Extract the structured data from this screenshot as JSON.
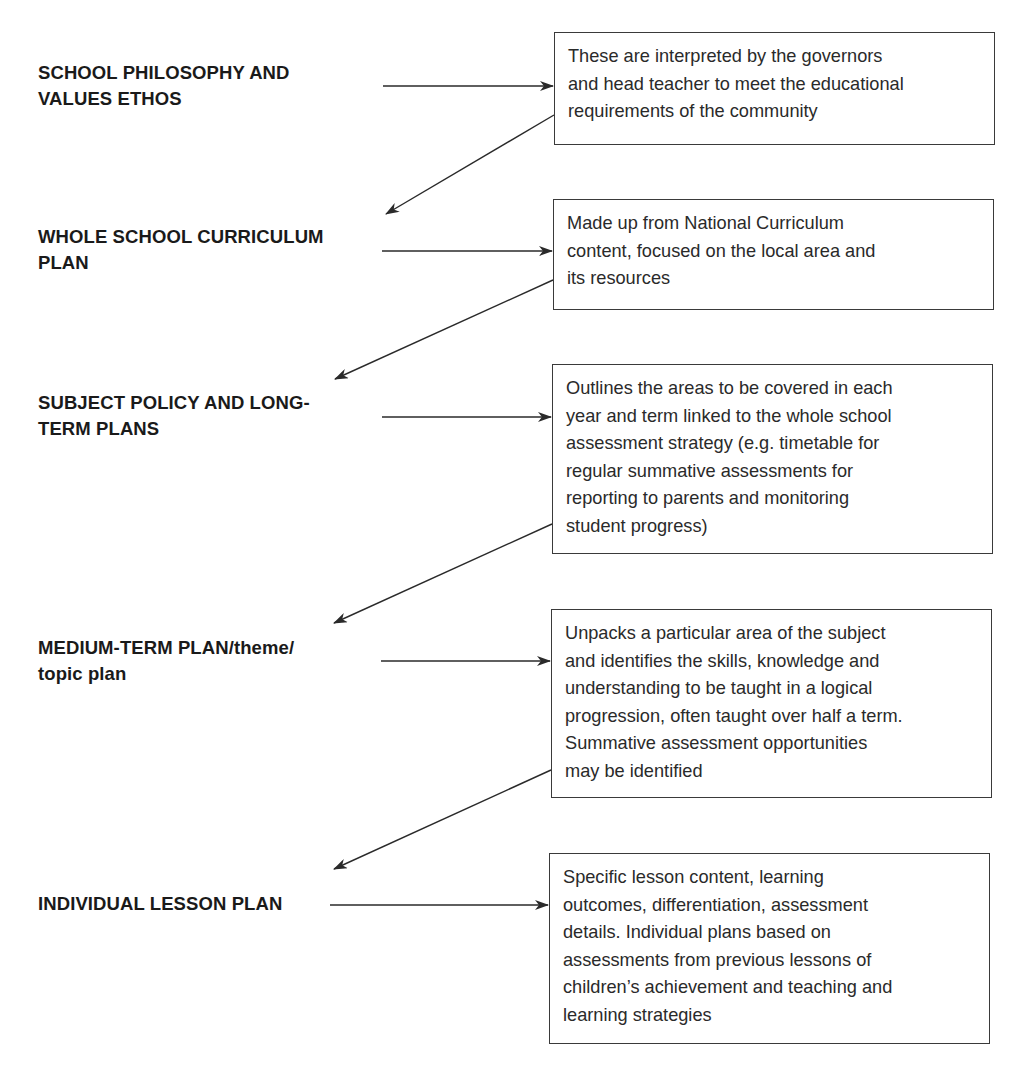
{
  "diagram": {
    "type": "flowchart",
    "stages": [
      {
        "label_lines": [
          "SCHOOL PHILOSOPHY AND",
          "VALUES ETHOS"
        ],
        "description_lines": [
          "These are interpreted by the governors",
          "and head teacher to meet the educational",
          "requirements of the community"
        ]
      },
      {
        "label_lines": [
          "WHOLE SCHOOL CURRICULUM",
          "PLAN"
        ],
        "description_lines": [
          "Made up from National Curriculum",
          "content, focused on the local area and",
          "its resources"
        ]
      },
      {
        "label_lines": [
          "SUBJECT POLICY AND LONG-",
          "TERM PLANS"
        ],
        "description_lines": [
          "Outlines the areas to be covered in each",
          "year and term linked to the whole school",
          "assessment strategy (e.g. timetable for",
          "regular summative assessments for",
          "reporting to parents and monitoring",
          "student progress)"
        ]
      },
      {
        "label_lines": [
          "MEDIUM-TERM PLAN/theme/",
          "topic plan"
        ],
        "description_lines": [
          "Unpacks a particular area of the subject",
          "and identifies the skills, knowledge and",
          "understanding to be taught in a logical",
          "progression, often taught over half a term.",
          "Summative assessment opportunities",
          "may be identified"
        ]
      },
      {
        "label_lines": [
          "INDIVIDUAL LESSON PLAN"
        ],
        "description_lines": [
          "Specific lesson content, learning",
          "outcomes, differentiation, assessment",
          "details. Individual plans based on",
          "assessments from previous lessons of",
          "children’s achievement and teaching and",
          "learning strategies"
        ]
      }
    ],
    "edges": [
      {
        "from": "stage-1-label",
        "to": "stage-1-box",
        "kind": "horizontal-arrow"
      },
      {
        "from": "stage-1-box",
        "to": "stage-2-label",
        "kind": "diagonal-arrow"
      },
      {
        "from": "stage-2-label",
        "to": "stage-2-box",
        "kind": "horizontal-arrow"
      },
      {
        "from": "stage-2-box",
        "to": "stage-3-label",
        "kind": "diagonal-arrow"
      },
      {
        "from": "stage-3-label",
        "to": "stage-3-box",
        "kind": "horizontal-arrow"
      },
      {
        "from": "stage-3-box",
        "to": "stage-4-label",
        "kind": "diagonal-arrow"
      },
      {
        "from": "stage-4-label",
        "to": "stage-4-box",
        "kind": "horizontal-arrow"
      },
      {
        "from": "stage-4-box",
        "to": "stage-5-label",
        "kind": "diagonal-arrow"
      },
      {
        "from": "stage-5-label",
        "to": "stage-5-box",
        "kind": "horizontal-arrow"
      }
    ],
    "colors": {
      "line": "#2a2a2a",
      "box_border": "#3a3a3a",
      "text": "#1e1e1e",
      "background": "#ffffff"
    }
  }
}
